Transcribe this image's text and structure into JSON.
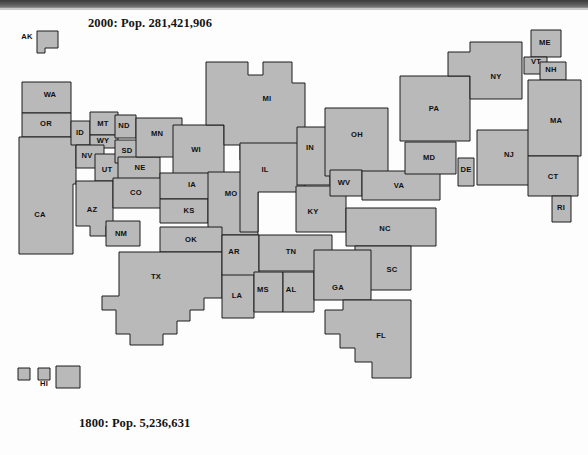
{
  "figure": {
    "type": "cartogram",
    "title_top": "2000: Pop. 281,421,906",
    "title_bottom": "1800: Pop. 5,236,631",
    "top_year": "2000",
    "top_population": "281,421,906",
    "bottom_year": "1800",
    "bottom_population": "5,236,631",
    "fill_color": "#b9b9b9",
    "stroke_color": "#1d1d1d",
    "background_color": "#fdfdfd",
    "text_color": "#141414"
  },
  "chart_data": {
    "type": "map",
    "title": "2000: Pop. 281,421,906",
    "subtitle": "1800: Pop. 5,236,631",
    "categories": [
      "AK",
      "WA",
      "OR",
      "ID",
      "MT",
      "ND",
      "MN",
      "WI",
      "MI",
      "NY",
      "ME",
      "VT",
      "NH",
      "MA",
      "CT",
      "RI",
      "NJ",
      "PA",
      "OH",
      "IN",
      "IL",
      "IA",
      "NE",
      "SD",
      "WY",
      "NV",
      "UT",
      "CO",
      "CA",
      "AZ",
      "NM",
      "TX",
      "OK",
      "KS",
      "MO",
      "AR",
      "LA",
      "MS",
      "AL",
      "TN",
      "KY",
      "WV",
      "VA",
      "MD",
      "DE",
      "NC",
      "SC",
      "GA",
      "FL",
      "HI"
    ],
    "states": [
      {
        "code": "AK",
        "label_x": 27,
        "label_y": 37,
        "label_anchor": "outside",
        "points": "37,31 58,31 58,48 45,48 45,53 37,53"
      },
      {
        "code": "WA",
        "label_x": 50,
        "label_y": 95,
        "points": "22,82 71,82 71,113 22,113"
      },
      {
        "code": "OR",
        "label_x": 46,
        "label_y": 124,
        "points": "22,113 71,113 71,137 22,137"
      },
      {
        "code": "CA",
        "label_x": 40,
        "label_y": 215,
        "points": "19,137 76,137 76,184 73,184 73,254 19,254"
      },
      {
        "code": "ID",
        "label_x": 80,
        "label_y": 133,
        "points": "71,121 90,121 90,145 71,145"
      },
      {
        "code": "MT",
        "label_x": 103,
        "label_y": 124,
        "points": "90,112 118,112 118,135 90,135"
      },
      {
        "code": "WY",
        "label_x": 103,
        "label_y": 141,
        "points": "90,135 118,135 118,148 90,148"
      },
      {
        "code": "NV",
        "label_x": 87,
        "label_y": 156,
        "points": "76,145 104,145 104,168 76,168"
      },
      {
        "code": "UT",
        "label_x": 107,
        "label_y": 170,
        "points": "95,154 120,154 120,181 95,181"
      },
      {
        "code": "AZ",
        "label_x": 92,
        "label_y": 210,
        "points": "76,181 113,181 113,226 106,226 106,236 90,236 90,226 76,226"
      },
      {
        "code": "NM",
        "label_x": 121,
        "label_y": 234,
        "points": "106,221 140,221 140,246 106,246"
      },
      {
        "code": "ND",
        "label_x": 124,
        "label_y": 126,
        "points": "115,115 136,115 136,138 115,138"
      },
      {
        "code": "SD",
        "label_x": 127,
        "label_y": 151,
        "points": "115,140 141,140 141,163 115,163"
      },
      {
        "code": "NE",
        "label_x": 140,
        "label_y": 168,
        "points": "118,157 160,157 160,180 118,180"
      },
      {
        "code": "CO",
        "label_x": 136,
        "label_y": 193,
        "points": "113,178 165,178 165,208 113,208"
      },
      {
        "code": "MN",
        "label_x": 157,
        "label_y": 134,
        "points": "136,118 182,118 182,157 136,157"
      },
      {
        "code": "WI",
        "label_x": 196,
        "label_y": 150,
        "points": "173,125 224,125 224,176 173,176"
      },
      {
        "code": "IA",
        "label_x": 192,
        "label_y": 185,
        "points": "160,173 220,173 220,199 160,199"
      },
      {
        "code": "KS",
        "label_x": 189,
        "label_y": 211,
        "points": "160,199 208,199 208,223 160,223"
      },
      {
        "code": "MO",
        "label_x": 231,
        "label_y": 194,
        "points": "208,172 258,172 258,235 208,235"
      },
      {
        "code": "OK",
        "label_x": 191,
        "label_y": 240,
        "points": "160,227 222,227 222,252 160,252"
      },
      {
        "code": "MI",
        "label_x": 267,
        "label_y": 99,
        "points": "206,62 248,62 248,75 263,75 263,62 292,62 292,83 305,83 305,160 240,160 240,145 224,145 224,125 206,125"
      },
      {
        "code": "IL",
        "label_x": 265,
        "label_y": 170,
        "points": "240,143 305,143 305,192 258,192 258,232 240,232"
      },
      {
        "code": "IN",
        "label_x": 310,
        "label_y": 148,
        "points": "297,127 330,127 330,185 297,185"
      },
      {
        "code": "OH",
        "label_x": 357,
        "label_y": 135,
        "points": "325,108 388,108 388,176 325,176"
      },
      {
        "code": "TX",
        "label_x": 156,
        "label_y": 277,
        "points": "119,252 222,252 222,298 204,298 204,310 190,310 190,321 177,321 177,334 163,334 163,345 130,345 130,334 116,334 116,310 102,310 102,296 119,296"
      },
      {
        "code": "LA",
        "label_x": 237,
        "label_y": 296,
        "points": "222,274 254,274 254,318 222,318"
      },
      {
        "code": "AR",
        "label_x": 234,
        "label_y": 252,
        "points": "222,235 259,235 259,275 222,275"
      },
      {
        "code": "MS",
        "label_x": 263,
        "label_y": 290,
        "points": "254,272 283,272 283,312 254,312"
      },
      {
        "code": "AL",
        "label_x": 291,
        "label_y": 290,
        "points": "283,272 314,272 314,312 283,312"
      },
      {
        "code": "TN",
        "label_x": 291,
        "label_y": 252,
        "points": "259,235 332,235 332,271 259,271"
      },
      {
        "code": "KY",
        "label_x": 313,
        "label_y": 212,
        "points": "296,186 346,186 346,232 296,232"
      },
      {
        "code": "WV",
        "label_x": 344,
        "label_y": 183,
        "points": "330,170 362,170 362,196 330,196"
      },
      {
        "code": "VA",
        "label_x": 399,
        "label_y": 186,
        "points": "362,171 440,171 440,200 362,200"
      },
      {
        "code": "NC",
        "label_x": 385,
        "label_y": 229,
        "points": "346,208 436,208 436,246 346,246"
      },
      {
        "code": "SC",
        "label_x": 392,
        "label_y": 270,
        "points": "355,246 411,246 411,290 355,290"
      },
      {
        "code": "GA",
        "label_x": 338,
        "label_y": 288,
        "points": "314,250 371,250 371,300 314,300"
      },
      {
        "code": "FL",
        "label_x": 381,
        "label_y": 336,
        "points": "343,300 411,300 411,378 372,378 372,362 355,362 355,348 340,348 340,334 325,334 325,310 343,310"
      },
      {
        "code": "MD",
        "label_x": 429,
        "label_y": 158,
        "points": "405,142 456,142 456,174 405,174"
      },
      {
        "code": "DE",
        "label_x": 466,
        "label_y": 170,
        "points": "458,158 474,158 474,186 458,186"
      },
      {
        "code": "PA",
        "label_x": 434,
        "label_y": 109,
        "points": "400,76 470,76 470,141 400,141"
      },
      {
        "code": "NJ",
        "label_x": 509,
        "label_y": 155,
        "points": "477,130 530,130 530,185 477,185"
      },
      {
        "code": "NY",
        "label_x": 496,
        "label_y": 77,
        "points": "448,52 470,52 470,42 522,42 522,99 470,99 470,76 448,76"
      },
      {
        "code": "ME",
        "label_x": 545,
        "label_y": 43,
        "points": "531,30 561,30 561,57 531,57"
      },
      {
        "code": "VT",
        "label_x": 536,
        "label_y": 62,
        "points": "524,57 547,57 547,74 524,74"
      },
      {
        "code": "NH",
        "label_x": 551,
        "label_y": 70,
        "points": "540,62 566,62 566,80 540,80"
      },
      {
        "code": "MA",
        "label_x": 556,
        "label_y": 121,
        "points": "528,80 581,80 581,156 528,156"
      },
      {
        "code": "CT",
        "label_x": 553,
        "label_y": 177,
        "points": "528,156 578,156 578,196 528,196"
      },
      {
        "code": "RI",
        "label_x": 561,
        "label_y": 208,
        "points": "552,196 571,196 571,222 552,222"
      },
      {
        "code": "HI",
        "label_x": 44,
        "label_y": 384,
        "label_anchor": "outside",
        "points": "18,368 30,368 30,380 18,380"
      }
    ],
    "extra_shapes": [
      {
        "name": "pacific-inset-b",
        "points": "38,368 50,368 50,380 38,380"
      },
      {
        "name": "pacific-inset-c",
        "points": "56,366 80,366 80,388 56,388"
      }
    ],
    "legend": null,
    "grid": false
  }
}
